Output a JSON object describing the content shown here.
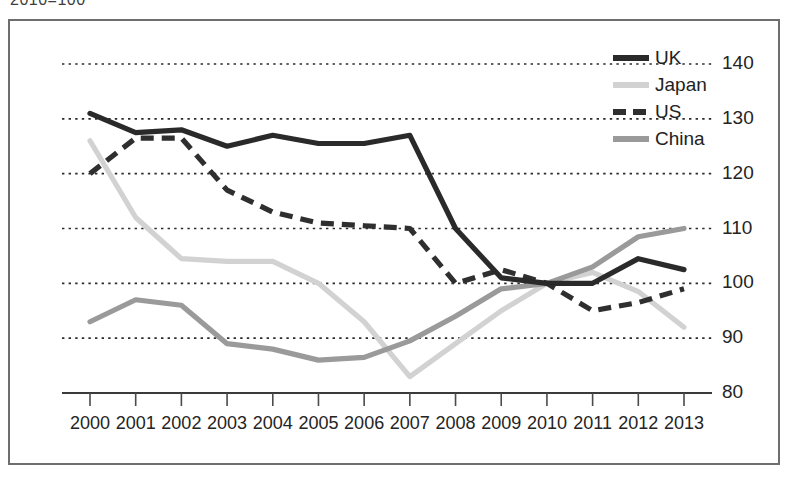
{
  "caption": "2010=100",
  "chart_data": {
    "type": "line",
    "title": "2010=100",
    "xlabel": "",
    "ylabel": "",
    "x": [
      "2000",
      "2001",
      "2002",
      "2003",
      "2004",
      "2005",
      "2006",
      "2007",
      "2008",
      "2009",
      "2010",
      "2011",
      "2012",
      "2013"
    ],
    "categories": [
      "2000",
      "2001",
      "2002",
      "2003",
      "2004",
      "2005",
      "2006",
      "2007",
      "2008",
      "2009",
      "2010",
      "2011",
      "2012",
      "2013"
    ],
    "ylim": [
      80,
      142
    ],
    "yticks": [
      80,
      90,
      100,
      110,
      120,
      130,
      140
    ],
    "ytick_labels": [
      "80",
      "90",
      "100",
      "110",
      "120",
      "130",
      "140"
    ],
    "grid": true,
    "legend_position": "top-right",
    "series": [
      {
        "name": "UK",
        "color": "#2a2a2a",
        "style": "solid",
        "values": [
          131,
          127.5,
          128,
          125,
          127,
          125.5,
          125.5,
          127,
          110,
          101,
          100,
          100,
          104.5,
          102.5
        ]
      },
      {
        "name": "Japan",
        "color": "#d2d2d2",
        "style": "solid",
        "values": [
          126,
          112,
          104.5,
          104,
          104,
          100,
          93,
          83,
          89,
          95,
          100,
          102,
          98.5,
          92
        ]
      },
      {
        "name": "US",
        "color": "#2f2f2f",
        "style": "dashed",
        "values": [
          120,
          126.5,
          126.5,
          117,
          113,
          111,
          110.5,
          110,
          100,
          102.5,
          100,
          95,
          96.5,
          99
        ]
      },
      {
        "name": "China",
        "color": "#9a9a9a",
        "style": "solid",
        "values": [
          93,
          97,
          96,
          89,
          88,
          86,
          86.5,
          89.5,
          94,
          99,
          100,
          103,
          108.5,
          110
        ]
      }
    ]
  },
  "legend": {
    "items": [
      {
        "label": "UK",
        "swatch": "sw-uk"
      },
      {
        "label": "Japan",
        "swatch": "sw-japan"
      },
      {
        "label": "US",
        "swatch": "sw-us"
      },
      {
        "label": "China",
        "swatch": "sw-china"
      }
    ]
  }
}
